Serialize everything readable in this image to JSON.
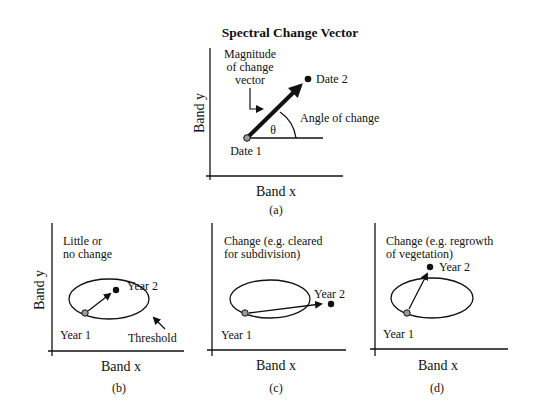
{
  "panel_a": {
    "title": "Spectral Change Vector",
    "magnitude_label": [
      "Magnitude",
      "of change",
      "vector"
    ],
    "date1": "Date 1",
    "date2": "Date 2",
    "angle_label": "Angle of change",
    "theta": "θ",
    "xlabel": "Band x",
    "ylabel": "Band y",
    "caption": "(a)"
  },
  "panel_b": {
    "note": [
      "Little or",
      "no change"
    ],
    "year1": "Year 1",
    "year2": "Year 2",
    "threshold": "Threshold",
    "xlabel": "Band x",
    "ylabel": "Band y",
    "caption": "(b)"
  },
  "panel_c": {
    "note": [
      "Change (e.g. cleared",
      "for subdivision)"
    ],
    "year1": "Year 1",
    "year2": "Year 2",
    "xlabel": "Band x",
    "caption": "(c)"
  },
  "panel_d": {
    "note": [
      "Change (e.g. regrowth",
      "of vegetation)"
    ],
    "year1": "Year 1",
    "year2": "Year 2",
    "xlabel": "Band x",
    "caption": "(d)"
  },
  "colors": {
    "ink": "#111111",
    "start_point_fill": "#9a9a9a",
    "background": "#ffffff"
  }
}
